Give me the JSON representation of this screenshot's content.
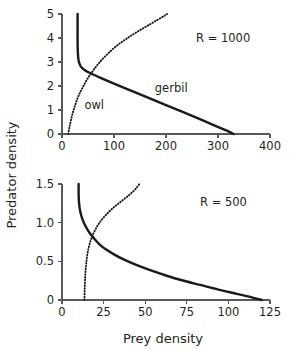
{
  "figure": {
    "axis_titles": {
      "x": "Prey density",
      "y": "Predator density"
    }
  },
  "chart_data": [
    {
      "type": "line",
      "panel": "top",
      "title": "",
      "annotation": "R = 1000",
      "xlabel": "Prey density",
      "ylabel": "Predator density",
      "xlim": [
        0,
        400
      ],
      "ylim": [
        0,
        5
      ],
      "xticks": [
        0,
        100,
        200,
        300,
        400
      ],
      "yticks": [
        0,
        1,
        2,
        3,
        4,
        5
      ],
      "xtick_labels": [
        "0",
        "100",
        "200",
        "300",
        "400"
      ],
      "ytick_labels": [
        "0",
        "1",
        "2",
        "3",
        "4",
        "5"
      ],
      "grid": false,
      "legend": "inline-labels",
      "series": [
        {
          "name": "gerbil",
          "style": "solid",
          "label": "gerbil",
          "label_x": 210,
          "label_y": 1.75,
          "points": [
            [
              30,
              5.0
            ],
            [
              30,
              4.4
            ],
            [
              30,
              3.8
            ],
            [
              30.5,
              3.4
            ],
            [
              32,
              3.05
            ],
            [
              36,
              2.82
            ],
            [
              44,
              2.66
            ],
            [
              56,
              2.52
            ],
            [
              72,
              2.36
            ],
            [
              92,
              2.17
            ],
            [
              116,
              1.95
            ],
            [
              142,
              1.72
            ],
            [
              170,
              1.47
            ],
            [
              200,
              1.2
            ],
            [
              232,
              0.92
            ],
            [
              264,
              0.63
            ],
            [
              296,
              0.33
            ],
            [
              316,
              0.15
            ],
            [
              330,
              0.0
            ]
          ]
        },
        {
          "name": "owl",
          "style": "dotted",
          "label": "owl",
          "label_x": 62,
          "label_y": 1.05,
          "points": [
            [
              12,
              0.0
            ],
            [
              14,
              0.25
            ],
            [
              17,
              0.55
            ],
            [
              21,
              0.9
            ],
            [
              26,
              1.25
            ],
            [
              32,
              1.6
            ],
            [
              40,
              1.95
            ],
            [
              49,
              2.3
            ],
            [
              60,
              2.65
            ],
            [
              72,
              2.98
            ],
            [
              86,
              3.3
            ],
            [
              101,
              3.6
            ],
            [
              118,
              3.88
            ],
            [
              136,
              4.14
            ],
            [
              154,
              4.38
            ],
            [
              170,
              4.58
            ],
            [
              184,
              4.76
            ],
            [
              195,
              4.9
            ],
            [
              202,
              5.0
            ]
          ]
        }
      ]
    },
    {
      "type": "line",
      "panel": "bottom",
      "title": "",
      "annotation": "R = 500",
      "xlabel": "Prey density",
      "ylabel": "Predator density",
      "xlim": [
        0,
        125
      ],
      "ylim": [
        0,
        1.5
      ],
      "xticks": [
        0,
        25,
        50,
        75,
        100,
        125
      ],
      "yticks": [
        0,
        0.5,
        1.0,
        1.5
      ],
      "xtick_labels": [
        "0",
        "25",
        "50",
        "75",
        "100",
        "125"
      ],
      "ytick_labels": [
        "0",
        "0.5",
        "1.0",
        "1.5"
      ],
      "grid": false,
      "legend": "none",
      "series": [
        {
          "name": "gerbil",
          "style": "solid",
          "points": [
            [
              10,
              1.5
            ],
            [
              10,
              1.36
            ],
            [
              10.3,
              1.24
            ],
            [
              11,
              1.14
            ],
            [
              12.2,
              1.05
            ],
            [
              14,
              0.96
            ],
            [
              16.5,
              0.87
            ],
            [
              19.5,
              0.79
            ],
            [
              23,
              0.71
            ],
            [
              27,
              0.645
            ],
            [
              32,
              0.58
            ],
            [
              38,
              0.515
            ],
            [
              45,
              0.45
            ],
            [
              53,
              0.385
            ],
            [
              62,
              0.32
            ],
            [
              72,
              0.255
            ],
            [
              83,
              0.195
            ],
            [
              94,
              0.135
            ],
            [
              105,
              0.08
            ],
            [
              114,
              0.035
            ],
            [
              120,
              0.0
            ]
          ]
        },
        {
          "name": "owl",
          "style": "dotted",
          "points": [
            [
              13.5,
              0.0
            ],
            [
              13.6,
              0.12
            ],
            [
              13.8,
              0.24
            ],
            [
              14.1,
              0.36
            ],
            [
              14.6,
              0.48
            ],
            [
              15.3,
              0.6
            ],
            [
              16.3,
              0.7
            ],
            [
              17.6,
              0.79
            ],
            [
              19.2,
              0.875
            ],
            [
              21.2,
              0.955
            ],
            [
              23.6,
              1.03
            ],
            [
              26.4,
              1.1
            ],
            [
              29.6,
              1.17
            ],
            [
              33.2,
              1.235
            ],
            [
              37,
              1.3
            ],
            [
              40.5,
              1.36
            ],
            [
              43.5,
              1.42
            ],
            [
              45.5,
              1.47
            ],
            [
              46.5,
              1.5
            ]
          ]
        }
      ]
    }
  ]
}
